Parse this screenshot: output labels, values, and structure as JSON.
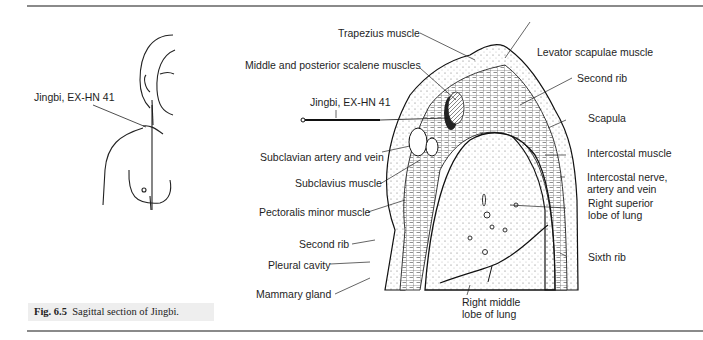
{
  "figure": {
    "caption_number": "Fig. 6.5",
    "caption_text": "Sagittal section of Jingbi."
  },
  "body_sketch": {
    "label": "Jingbi, EX-HN 41"
  },
  "section_labels": {
    "trapezius": "Trapezius muscle",
    "levator": "Levator scapulae muscle",
    "scalene": "Middle and posterior scalene muscles",
    "second_rib_top": "Second rib",
    "jingbi": "Jingbi, EX-HN 41",
    "scapula": "Scapula",
    "subclavian": "Subclavian artery and vein",
    "intercostal_muscle": "Intercostal muscle",
    "subclavius": "Subclavius muscle",
    "intercostal_nerve_1": "Intercostal nerve,",
    "intercostal_nerve_2": "artery and vein",
    "pectoralis": "Pectoralis minor muscle",
    "superior_lobe_1": "Right superior",
    "superior_lobe_2": "lobe of lung",
    "second_rib_bottom": "Second rib",
    "sixth_rib": "Sixth rib",
    "pleural": "Pleural cavity",
    "mammary": "Mammary gland",
    "middle_lobe_1": "Right middle",
    "middle_lobe_2": "lobe of lung"
  },
  "icons": [
    "acupuncture-needle-icon",
    "human-torso-sketch",
    "sagittal-section-drawing"
  ]
}
